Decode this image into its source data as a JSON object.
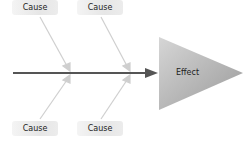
{
  "diagram": {
    "type": "fishbone",
    "effect": {
      "label": "Effect"
    },
    "causes": [
      {
        "label": "Cause",
        "position": "top-left"
      },
      {
        "label": "Cause",
        "position": "top-right"
      },
      {
        "label": "Cause",
        "position": "bottom-left"
      },
      {
        "label": "Cause",
        "position": "bottom-right"
      }
    ],
    "colors": {
      "spine": "#555555",
      "bones": "#c8c8c8",
      "effect_fill_start": "#c4c4c4",
      "effect_fill_end": "#9c9c9c",
      "cause_box": "#e8e8e8"
    }
  }
}
